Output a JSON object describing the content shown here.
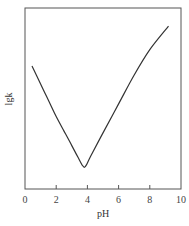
{
  "chart_data": {
    "type": "line",
    "title": "",
    "xlabel": "pH",
    "ylabel": "lgk",
    "xlim": [
      0,
      10
    ],
    "ylim": [
      0,
      10
    ],
    "x_ticks": [
      0,
      2,
      4,
      6,
      8,
      10
    ],
    "x_tick_labels": [
      "0",
      "2",
      "4",
      "6",
      "8",
      "10"
    ],
    "y_ticks": [],
    "grid": false,
    "legend": null,
    "series": [
      {
        "name": "lgk vs pH",
        "x": [
          0.45,
          1.0,
          1.5,
          2.0,
          2.5,
          3.0,
          3.4,
          3.65,
          3.8,
          3.95,
          4.2,
          5.0,
          6.0,
          7.0,
          8.0,
          9.2
        ],
        "y": [
          6.8,
          5.8,
          4.9,
          4.0,
          3.2,
          2.4,
          1.75,
          1.35,
          1.2,
          1.35,
          1.8,
          3.1,
          4.7,
          6.3,
          7.7,
          9.0
        ]
      }
    ],
    "note": "y-axis has no numeric ticks; lgk values are relative (0 = bottom axis, 10 = top frame)"
  },
  "axes": {
    "xlabel": "pH",
    "ylabel": "lgk",
    "x_tick_labels": [
      "0",
      "2",
      "4",
      "6",
      "8",
      "10"
    ]
  }
}
